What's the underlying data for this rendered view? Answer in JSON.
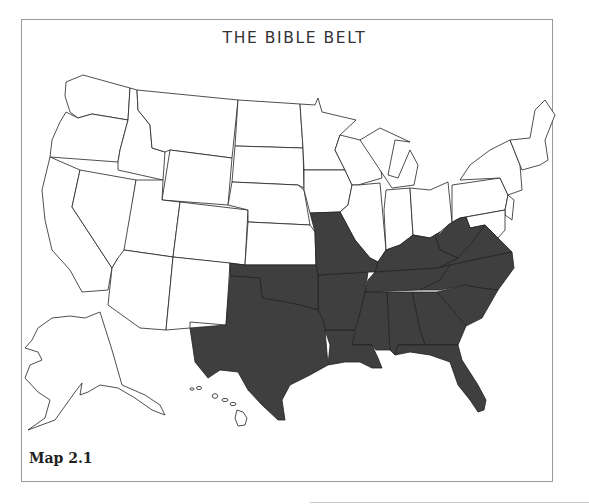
{
  "map": {
    "title": "THE BIBLE BELT",
    "caption": "Map 2.1",
    "subject": "United States",
    "highlight_color": "#3f3f3f",
    "base_color": "#ffffff",
    "highlighted_states": [
      "Texas",
      "Oklahoma",
      "Missouri",
      "Arkansas",
      "Louisiana",
      "Mississippi",
      "Alabama",
      "Georgia",
      "Florida",
      "South Carolina",
      "North Carolina",
      "Tennessee",
      "Kentucky",
      "Virginia",
      "West Virginia"
    ],
    "insets": [
      "Alaska",
      "Hawaii"
    ]
  }
}
